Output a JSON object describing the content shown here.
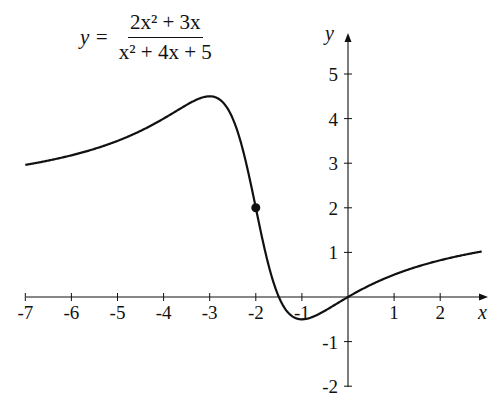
{
  "chart_data": {
    "type": "line",
    "equation": {
      "lhs": "y =",
      "numerator": "2x² + 3x",
      "denominator": "x² + 4x + 5",
      "coefficients": {
        "num": [
          2,
          3,
          0
        ],
        "den": [
          1,
          4,
          5
        ]
      }
    },
    "xlabel": "x",
    "ylabel": "y",
    "xlim": [
      -7,
      2.9
    ],
    "ylim": [
      -2,
      5.5
    ],
    "x_ticks": [
      -7,
      -6,
      -5,
      -4,
      -3,
      -2,
      -1,
      1,
      2
    ],
    "y_ticks": [
      -2,
      -1,
      1,
      2,
      3,
      4,
      5
    ],
    "grid": false,
    "legend": null,
    "series": [
      {
        "name": "f(x)",
        "x": [
          -7,
          -6,
          -5,
          -4,
          -3,
          -2.5,
          -2,
          -1.5,
          -1,
          -0.5,
          0,
          1,
          2,
          3
        ],
        "y": [
          2.92,
          3.12,
          3.5,
          4.0,
          4.5,
          4.0,
          2.0,
          0.0,
          -0.5,
          -0.31,
          0,
          0.5,
          0.82,
          1.04
        ]
      }
    ],
    "annotations": [
      {
        "type": "point",
        "x": -2,
        "y": 2,
        "label": ""
      }
    ],
    "extrema": {
      "max": {
        "x": -3,
        "y": 4.5
      },
      "min": {
        "x": -1,
        "y": -0.5
      }
    }
  },
  "layout": {
    "origin_px": [
      348,
      297
    ],
    "x_scale": 46.1,
    "y_scale": 44.6,
    "x_axis_px": [
      26,
      488
    ],
    "y_axis_px": [
      387,
      33
    ],
    "line_color": "#111111"
  }
}
